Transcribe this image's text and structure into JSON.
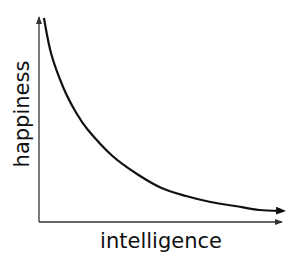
{
  "chart_data": {
    "type": "line",
    "title": "",
    "xlabel": "intelligence",
    "ylabel": "happiness",
    "grid": false,
    "legend": "none",
    "xlim": [
      0,
      1
    ],
    "ylim": [
      0,
      1
    ],
    "series": [
      {
        "name": "happiness vs intelligence",
        "x": [
          0.02,
          0.05,
          0.1,
          0.15,
          0.2,
          0.3,
          0.4,
          0.5,
          0.6,
          0.7,
          0.8,
          0.9,
          1.0
        ],
        "y": [
          1.0,
          0.82,
          0.65,
          0.53,
          0.44,
          0.31,
          0.22,
          0.15,
          0.11,
          0.08,
          0.06,
          0.04,
          0.035
        ]
      }
    ]
  },
  "colors": {
    "axis": "#333333",
    "curve": "#111111"
  }
}
